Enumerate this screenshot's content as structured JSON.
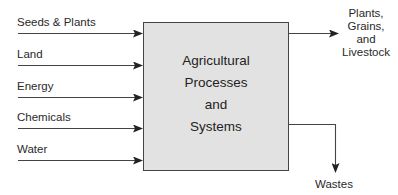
{
  "diagram": {
    "process": {
      "lines": [
        "Agricultural",
        "Processes",
        "and",
        "Systems"
      ]
    },
    "inputs": [
      {
        "label": "Seeds & Plants"
      },
      {
        "label": "Land"
      },
      {
        "label": "Energy"
      },
      {
        "label": "Chemicals"
      },
      {
        "label": "Water"
      }
    ],
    "outputs": {
      "product": {
        "lines": [
          "Plants,",
          "Grains,",
          "and",
          "Livestock"
        ]
      },
      "waste": {
        "label": "Wastes"
      }
    },
    "colors": {
      "box_fill": "#e2e2e2",
      "stroke": "#333333"
    }
  }
}
